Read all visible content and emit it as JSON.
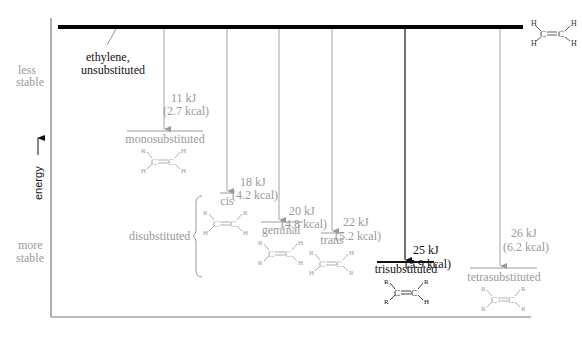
{
  "axis": {
    "y_label": "energy",
    "top_label": [
      "less",
      "stable"
    ],
    "bottom_label": [
      "more",
      "stable"
    ]
  },
  "reference": {
    "label_line1": "ethylene,",
    "label_line2": "unsubstituted",
    "structure": {
      "left_top": "H",
      "left_bottom": "H",
      "right_top": "H",
      "right_bottom": "H",
      "c1": "C",
      "c2": "C"
    }
  },
  "group_label": "disubstituted",
  "levels": [
    {
      "name": "monosubstituted",
      "kj": "11 kJ",
      "kcal": "(2.7 kcal)",
      "lt": "R",
      "lb": "H",
      "rt": "H",
      "rb": "H",
      "highlight": false
    },
    {
      "name": "cis",
      "kj": "18 kJ",
      "kcal": "(4.2 kcal)",
      "lt": "R",
      "lb": "H",
      "rt": "R",
      "rb": "H",
      "highlight": false
    },
    {
      "name": "geminal",
      "kj": "20 kJ",
      "kcal": "(4.8 kcal)",
      "lt": "R",
      "lb": "R",
      "rt": "H",
      "rb": "H",
      "highlight": false
    },
    {
      "name": "trans",
      "kj": "22 kJ",
      "kcal": "(5.2 kcal)",
      "lt": "R",
      "lb": "H",
      "rt": "H",
      "rb": "R",
      "highlight": false
    },
    {
      "name": "trisubstituted",
      "kj": "25 kJ",
      "kcal": "(5.9 kcal)",
      "lt": "R",
      "lb": "R",
      "rt": "R",
      "rb": "H",
      "highlight": true
    },
    {
      "name": "tetrasubstituted",
      "kj": "26 kJ",
      "kcal": "(6.2 kcal)",
      "lt": "R",
      "lb": "R",
      "rt": "R",
      "rb": "R",
      "highlight": false
    }
  ],
  "atom_c": "C",
  "colors": {
    "muted": "#9a9a9a",
    "emphasis": "#111111"
  }
}
